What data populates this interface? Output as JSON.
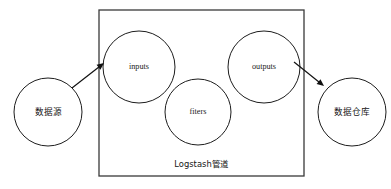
{
  "diagram": {
    "background_color": "#ffffff",
    "stroke_color": "#1d1d1d",
    "container": {
      "label": "Logstash管道",
      "x": 99,
      "y": 10,
      "width": 205,
      "height": 166,
      "label_x": 201,
      "label_y": 164
    },
    "nodes": [
      {
        "id": "data-source",
        "label": "数据源",
        "script": "cjk",
        "cx": 48,
        "cy": 112,
        "r": 34,
        "inside_container": false
      },
      {
        "id": "inputs",
        "label": "inputs",
        "script": "latin",
        "cx": 139,
        "cy": 67,
        "r": 36,
        "inside_container": true
      },
      {
        "id": "fiters",
        "label": "fiters",
        "script": "latin",
        "cx": 198,
        "cy": 112,
        "r": 33,
        "inside_container": true
      },
      {
        "id": "outputs",
        "label": "outputs",
        "script": "latin",
        "cx": 264,
        "cy": 67,
        "r": 36,
        "inside_container": true
      },
      {
        "id": "data-warehouse",
        "label": "数据仓库",
        "script": "cjk",
        "cx": 352,
        "cy": 112,
        "r": 34,
        "inside_container": false
      }
    ],
    "arrows": [
      {
        "id": "source-to-inputs",
        "from": "data-source",
        "to": "inputs",
        "x1": 72,
        "y1": 88,
        "x2": 104,
        "y2": 63
      },
      {
        "id": "outputs-to-warehouse",
        "from": "outputs",
        "to": "data-warehouse",
        "x1": 294,
        "y1": 62,
        "x2": 324,
        "y2": 86
      }
    ]
  }
}
